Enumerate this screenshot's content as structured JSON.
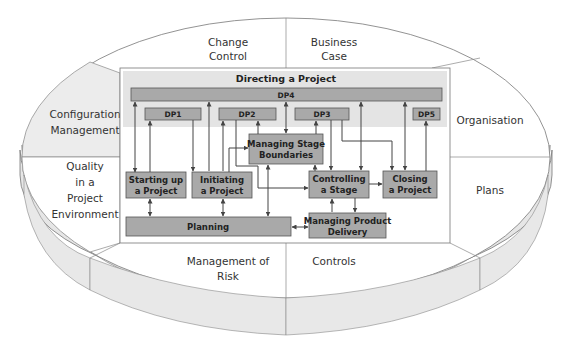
{
  "diagram": {
    "outer_segments": {
      "change_control": [
        "Change",
        "Control"
      ],
      "business_case": [
        "Business",
        "Case"
      ],
      "configuration_management": [
        "Configuration",
        "Management"
      ],
      "organisation": [
        "Organisation"
      ],
      "quality": [
        "Quality",
        "in a",
        "Project",
        "Environment"
      ],
      "plans": [
        "Plans"
      ],
      "management_of_risk": [
        "Management of",
        "Risk"
      ],
      "controls": [
        "Controls"
      ]
    },
    "directing": {
      "title": "Directing a Project",
      "dp4": "DP4",
      "dp1": "DP1",
      "dp2": "DP2",
      "dp3": "DP3",
      "dp5": "DP5"
    },
    "processes": {
      "managing_stage_boundaries": [
        "Managing Stage",
        "Boundaries"
      ],
      "starting_up": [
        "Starting up",
        "a Project"
      ],
      "initiating": [
        "Initiating",
        "a Project"
      ],
      "controlling": [
        "Controlling",
        "a Stage"
      ],
      "closing": [
        "Closing",
        "a Project"
      ],
      "planning": "Planning",
      "managing_product_delivery": [
        "Managing Product",
        "Delivery"
      ]
    },
    "colors": {
      "process_fill": "#a9a9a9",
      "directing_band": "#e4e4e4",
      "ring_side": "#e6e6e6"
    }
  }
}
